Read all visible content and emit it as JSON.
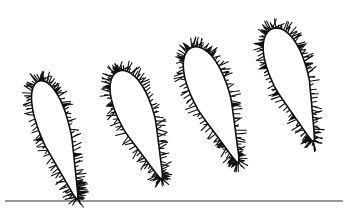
{
  "figure": {
    "colors": {
      "ink": "#111111",
      "background": "#ffffff",
      "ground": "#333333"
    },
    "ground_line": {
      "x1": 5,
      "x2": 343,
      "y": 201
    },
    "shapes": [
      {
        "id": "leaf-1",
        "cx": 58,
        "cy": 140,
        "rx": 19,
        "ry": 62,
        "rotate": 18,
        "tip_x": 40,
        "tip_y": 201,
        "stem_x": 86,
        "stem_y": 75
      },
      {
        "id": "leaf-2",
        "cx": 140,
        "cy": 125,
        "rx": 22,
        "ry": 58,
        "rotate": 22,
        "tip_x": 114,
        "tip_y": 186,
        "stem_x": 168,
        "stem_y": 60
      },
      {
        "id": "leaf-3",
        "cx": 215,
        "cy": 105,
        "rx": 23,
        "ry": 62,
        "rotate": 22,
        "tip_x": 195,
        "tip_y": 175,
        "stem_x": 237,
        "stem_y": 38
      },
      {
        "id": "leaf-4",
        "cx": 293,
        "cy": 85,
        "rx": 23,
        "ry": 60,
        "rotate": 20,
        "tip_x": 280,
        "tip_y": 155,
        "stem_x": 309,
        "stem_y": 18
      }
    ]
  }
}
